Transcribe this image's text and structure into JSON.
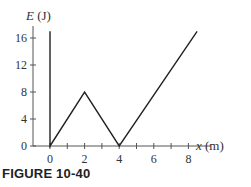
{
  "caption": "FIGURE 10-40",
  "chart_data": {
    "type": "line",
    "title": "",
    "xlabel": "x (m)",
    "ylabel": "E (J)",
    "xlim": [
      -1,
      9
    ],
    "ylim": [
      0,
      17
    ],
    "x_ticks": [
      0,
      2,
      4,
      6,
      8
    ],
    "x_minor_ticks": [
      1,
      3,
      5,
      7
    ],
    "y_ticks": [
      0,
      4,
      8,
      12,
      16
    ],
    "grid": false,
    "series": [
      {
        "name": "potential energy",
        "x": [
          0,
          0,
          2,
          4,
          8.5
        ],
        "y": [
          17,
          0,
          8,
          0,
          17
        ]
      }
    ]
  },
  "colors": {
    "line": "#222222",
    "axis": "#555555",
    "text": "#333333"
  }
}
